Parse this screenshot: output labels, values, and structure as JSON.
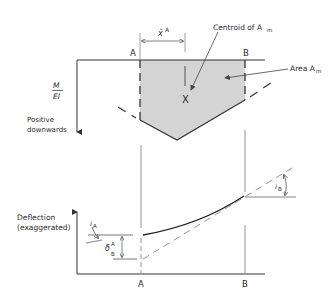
{
  "figure": {
    "top_panel": {
      "y_axis_label_num": "M",
      "y_axis_label_den": "EI",
      "y_axis_note_line1": "Positive",
      "y_axis_note_line2": "downwards",
      "point_a": "A",
      "point_b": "B",
      "xbar_label": "x̄",
      "xbar_sup": "A",
      "centroid_label": "Centroid of A",
      "centroid_sub": "m",
      "centroid_marker": "X",
      "area_label": "Area A",
      "area_sub": "m",
      "fill_color": "#d4d4d4"
    },
    "bottom_panel": {
      "y_axis_label_line1": "Deflection",
      "y_axis_label_line2": "(exaggerated)",
      "point_a": "A",
      "point_b": "B",
      "slope_a_label": "i",
      "slope_a_sub": "A",
      "delta_label": "δ",
      "delta_sup": "A",
      "delta_sub": "B",
      "slope_b_label": "i",
      "slope_b_sub": "B"
    }
  }
}
